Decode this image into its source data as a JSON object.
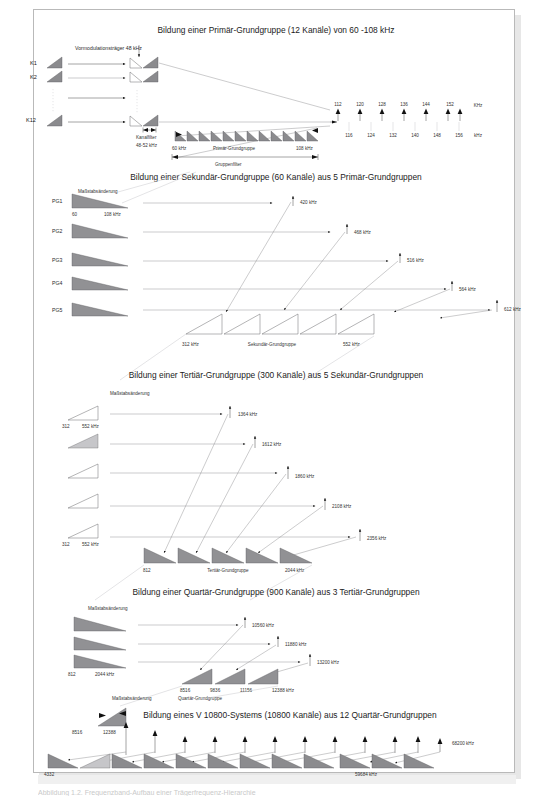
{
  "page": {
    "background_color": "#ffffff",
    "sheet_border_color": "#b9b9b9",
    "caption": "Abbildung 1.2.  Frequenzband-Aufbau einer Trägerfrequenz-Hierarchie"
  },
  "sections": {
    "primary": {
      "title": "Bildung einer Primär-Grundgruppe (12 Kanäle) von 60 -108 kHz",
      "carrier_label": "Vormodulationsträger 48 kHz",
      "channel_labels": [
        "K1",
        "K2",
        "K12"
      ],
      "channel_filter_label": "Kanalfilter",
      "channel_filter_range": "48-52 kHz",
      "group_label": "Primär-Grundgruppe",
      "group_filter_label": "Gruppenfilter",
      "group_start": "60 kHz",
      "group_end": "108 kHz",
      "axis_unit_top": "KHz",
      "axis_unit_bottom": "kHz",
      "axis_top_ticks": [
        "112",
        "120",
        "128",
        "136",
        "144",
        "152"
      ],
      "axis_bottom_ticks": [
        "116",
        "124",
        "132",
        "140",
        "148",
        "156"
      ]
    },
    "secondary": {
      "title": "Bildung einer Sekundär-Grundgruppe (60 Kanäle) aus 5 Primär-Grundgruppen",
      "scale_note": "Maßstabsänderung",
      "input_labels": [
        "PG1",
        "PG2",
        "PG3",
        "PG4",
        "PG5"
      ],
      "input_start": "60",
      "input_end": "108 kHz",
      "carriers": [
        "420 kHz",
        "468 kHz",
        "516 kHz",
        "564 kHz",
        "612 kHz"
      ],
      "output_label": "Sekundär-Grundgruppe",
      "output_start": "312 kHz",
      "output_end": "552 kHz"
    },
    "tertiary": {
      "title": "Bildung einer Tertiär-Grundgruppe (300 Kanäle) aus 5 Sekundär-Grundgruppen",
      "scale_note": "Maßstabsänderung",
      "input_start": "312",
      "input_end": "552 kHz",
      "carriers": [
        "1364 kHz",
        "1612 kHz",
        "1860 kHz",
        "2108 kHz",
        "2356 kHz"
      ],
      "output_label": "Tertiär-Grundgruppe",
      "output_start": "812",
      "output_end": "2044 kHz"
    },
    "quaternary": {
      "title": "Bildung einer Quartär-Grundgruppe (900 Kanäle) aus 3 Tertiär-Grundgruppen",
      "scale_note": "Maßstabsänderung",
      "input_start": "812",
      "input_end": "2044 kHz",
      "carriers": [
        "10560 kHz",
        "11880 kHz",
        "13200 kHz"
      ],
      "output_label": "Quartär-Grundgruppe",
      "output_ticks": [
        "8516",
        "9836",
        "11156",
        "12388 kHz"
      ]
    },
    "system": {
      "title": "Bildung eines V 10800-Systems (10800 Kanäle) aus 12 Quartär-Grundgruppen",
      "scale_note": "Maßstabsänderung",
      "input_start": "8516",
      "input_end": "12388",
      "carrier": "68200 kHz",
      "output_start": "4332",
      "output_end": "59684 kHz"
    }
  }
}
